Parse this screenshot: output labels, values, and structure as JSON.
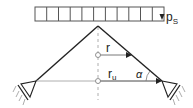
{
  "diagram": {
    "type": "structural-schematic",
    "colors": {
      "line": "#222222",
      "light_line": "#999999",
      "background": "#ffffff"
    },
    "load": {
      "label": "p",
      "subscript": "S",
      "cells": 11,
      "arrow_direction": "down"
    },
    "dimensions": {
      "inner_radius": {
        "label": "r"
      },
      "outer_radius": {
        "label": "r",
        "subscript": "u"
      },
      "angle": {
        "label": "α"
      }
    },
    "supports": [
      {
        "side": "left",
        "type": "pinned"
      },
      {
        "side": "right",
        "type": "pinned"
      }
    ]
  }
}
